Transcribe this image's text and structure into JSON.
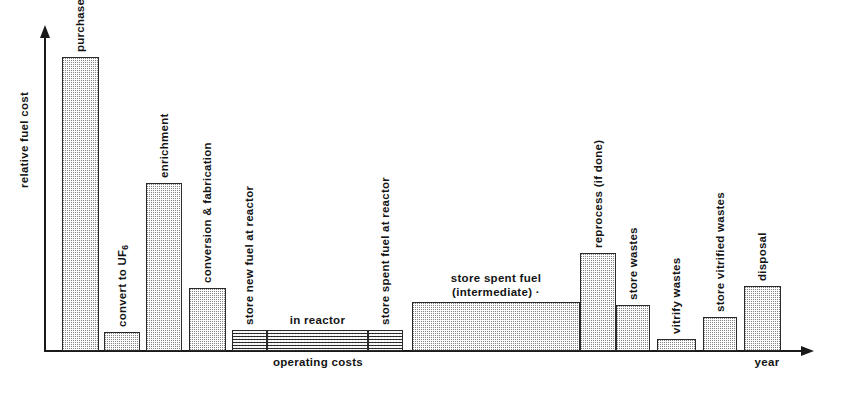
{
  "chart_data": {
    "type": "bar",
    "title": "",
    "xlabel": "year",
    "ylabel": "relative fuel cost",
    "grid": false,
    "legend": "none",
    "note": "Schematic nuclear fuel-cycle cash-flow diagram; bar widths span time, heights are relative cost. Values are read off the unlabelled y-axis as fractions of the tallest bar (purchase uranium = 1.00).",
    "ylim": [
      0,
      1.05
    ],
    "categories": [
      "purchase uranium",
      "convert to UF6",
      "enrichment",
      "conversion & fabrication",
      "store new fuel at reactor",
      "in reactor",
      "store spent fuel at reactor",
      "store spent fuel (intermediate)",
      "reprocess (if done)",
      "store wastes",
      "vitrify wastes",
      "store vitrified wastes",
      "disposal"
    ],
    "values": [
      1.0,
      0.065,
      0.57,
      0.215,
      0.07,
      0.07,
      0.07,
      0.165,
      0.335,
      0.155,
      0.04,
      0.115,
      0.22
    ],
    "bars": [
      {
        "id": "purchase-uranium",
        "label": "purchase uranium",
        "label_orientation": "vertical",
        "x0": 62,
        "x1": 99,
        "value": 1.0,
        "texture": "stipple"
      },
      {
        "id": "convert-to-uf6",
        "label": "convert to UF",
        "label_sub": "6",
        "label_orientation": "vertical",
        "x0": 104,
        "x1": 140,
        "value": 0.065,
        "texture": "stipple"
      },
      {
        "id": "enrichment",
        "label": "enrichment",
        "label_orientation": "vertical",
        "x0": 146,
        "x1": 182,
        "value": 0.57,
        "texture": "stipple"
      },
      {
        "id": "conversion-and-fabrication",
        "label": "conversion & fabrication",
        "label_orientation": "vertical",
        "x0": 189,
        "x1": 226,
        "value": 0.215,
        "texture": "stipple"
      },
      {
        "id": "store-new-fuel-at-reactor",
        "label": "store new fuel at reactor",
        "label_orientation": "vertical",
        "x0": 232,
        "x1": 267,
        "value": 0.07,
        "texture": "dense"
      },
      {
        "id": "in-reactor",
        "label": "in reactor",
        "label_orientation": "horizontal",
        "x0": 267,
        "x1": 368,
        "value": 0.07,
        "texture": "dense"
      },
      {
        "id": "store-spent-fuel-at-reactor",
        "label": "store spent fuel at reactor",
        "label_orientation": "vertical",
        "x0": 368,
        "x1": 403,
        "value": 0.07,
        "texture": "dense"
      },
      {
        "id": "store-spent-fuel-intermediate",
        "label": "store spent fuel\n(intermediate) ·",
        "label_orientation": "horizontal",
        "x0": 412,
        "x1": 580,
        "value": 0.165,
        "texture": "stipple"
      },
      {
        "id": "reprocess-if-done",
        "label": "reprocess (if done)",
        "label_orientation": "vertical",
        "x0": 580,
        "x1": 616,
        "value": 0.335,
        "texture": "stipple"
      },
      {
        "id": "store-wastes",
        "label": "store wastes",
        "label_orientation": "vertical",
        "x0": 616,
        "x1": 650,
        "value": 0.155,
        "texture": "stipple"
      },
      {
        "id": "vitrify-wastes",
        "label": "vitrify wastes",
        "label_orientation": "vertical",
        "x0": 657,
        "x1": 696,
        "value": 0.04,
        "texture": "stipple"
      },
      {
        "id": "store-vitrified-wastes",
        "label": "store vitrified wastes",
        "label_orientation": "vertical",
        "x0": 703,
        "x1": 737,
        "value": 0.115,
        "texture": "stipple"
      },
      {
        "id": "disposal",
        "label": "disposal",
        "label_orientation": "vertical",
        "x0": 744,
        "x1": 781,
        "value": 0.22,
        "texture": "stipple"
      }
    ],
    "annotations": [
      {
        "id": "operating-costs",
        "text": "operating costs",
        "x": 318,
        "y": 363,
        "orientation": "horizontal"
      }
    ]
  },
  "axes": {
    "y_title": "relative fuel cost",
    "x_title": "year"
  },
  "labels": {
    "purchase_uranium": "purchase uranium",
    "convert_to_uf6": "convert to UF",
    "convert_to_uf6_sub": "6",
    "enrichment": "enrichment",
    "conversion_and_fabrication": "conversion & fabrication",
    "store_new_fuel_at_reactor": "store new fuel at reactor",
    "in_reactor": "in reactor",
    "store_spent_fuel_at_reactor": "store spent fuel at reactor",
    "store_spent_fuel_intermediate_line1": "store spent fuel",
    "store_spent_fuel_intermediate_line2": "(intermediate) ·",
    "reprocess_if_done": "reprocess (if done)",
    "store_wastes": "store wastes",
    "vitrify_wastes": "vitrify wastes",
    "store_vitrified_wastes": "store vitrified wastes",
    "disposal": "disposal",
    "operating_costs": "operating costs"
  },
  "colors": {
    "ink": "#141414",
    "bar_fill": "#d9d9d9",
    "bar_border": "#2a2a2a",
    "background": "#ffffff"
  }
}
